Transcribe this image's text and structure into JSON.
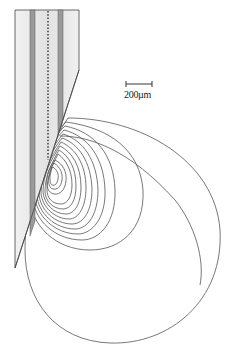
{
  "figure": {
    "scale_bar": {
      "label": "200µm",
      "length_px": 26
    },
    "probe": {
      "outer_fill": "#e8e8e8",
      "band_fill": "#9a9a9a",
      "stroke": "#444444",
      "center_line": "dashed"
    },
    "contours": {
      "count": 14,
      "stroke": "#555555",
      "center": [
        52,
        170
      ]
    }
  }
}
